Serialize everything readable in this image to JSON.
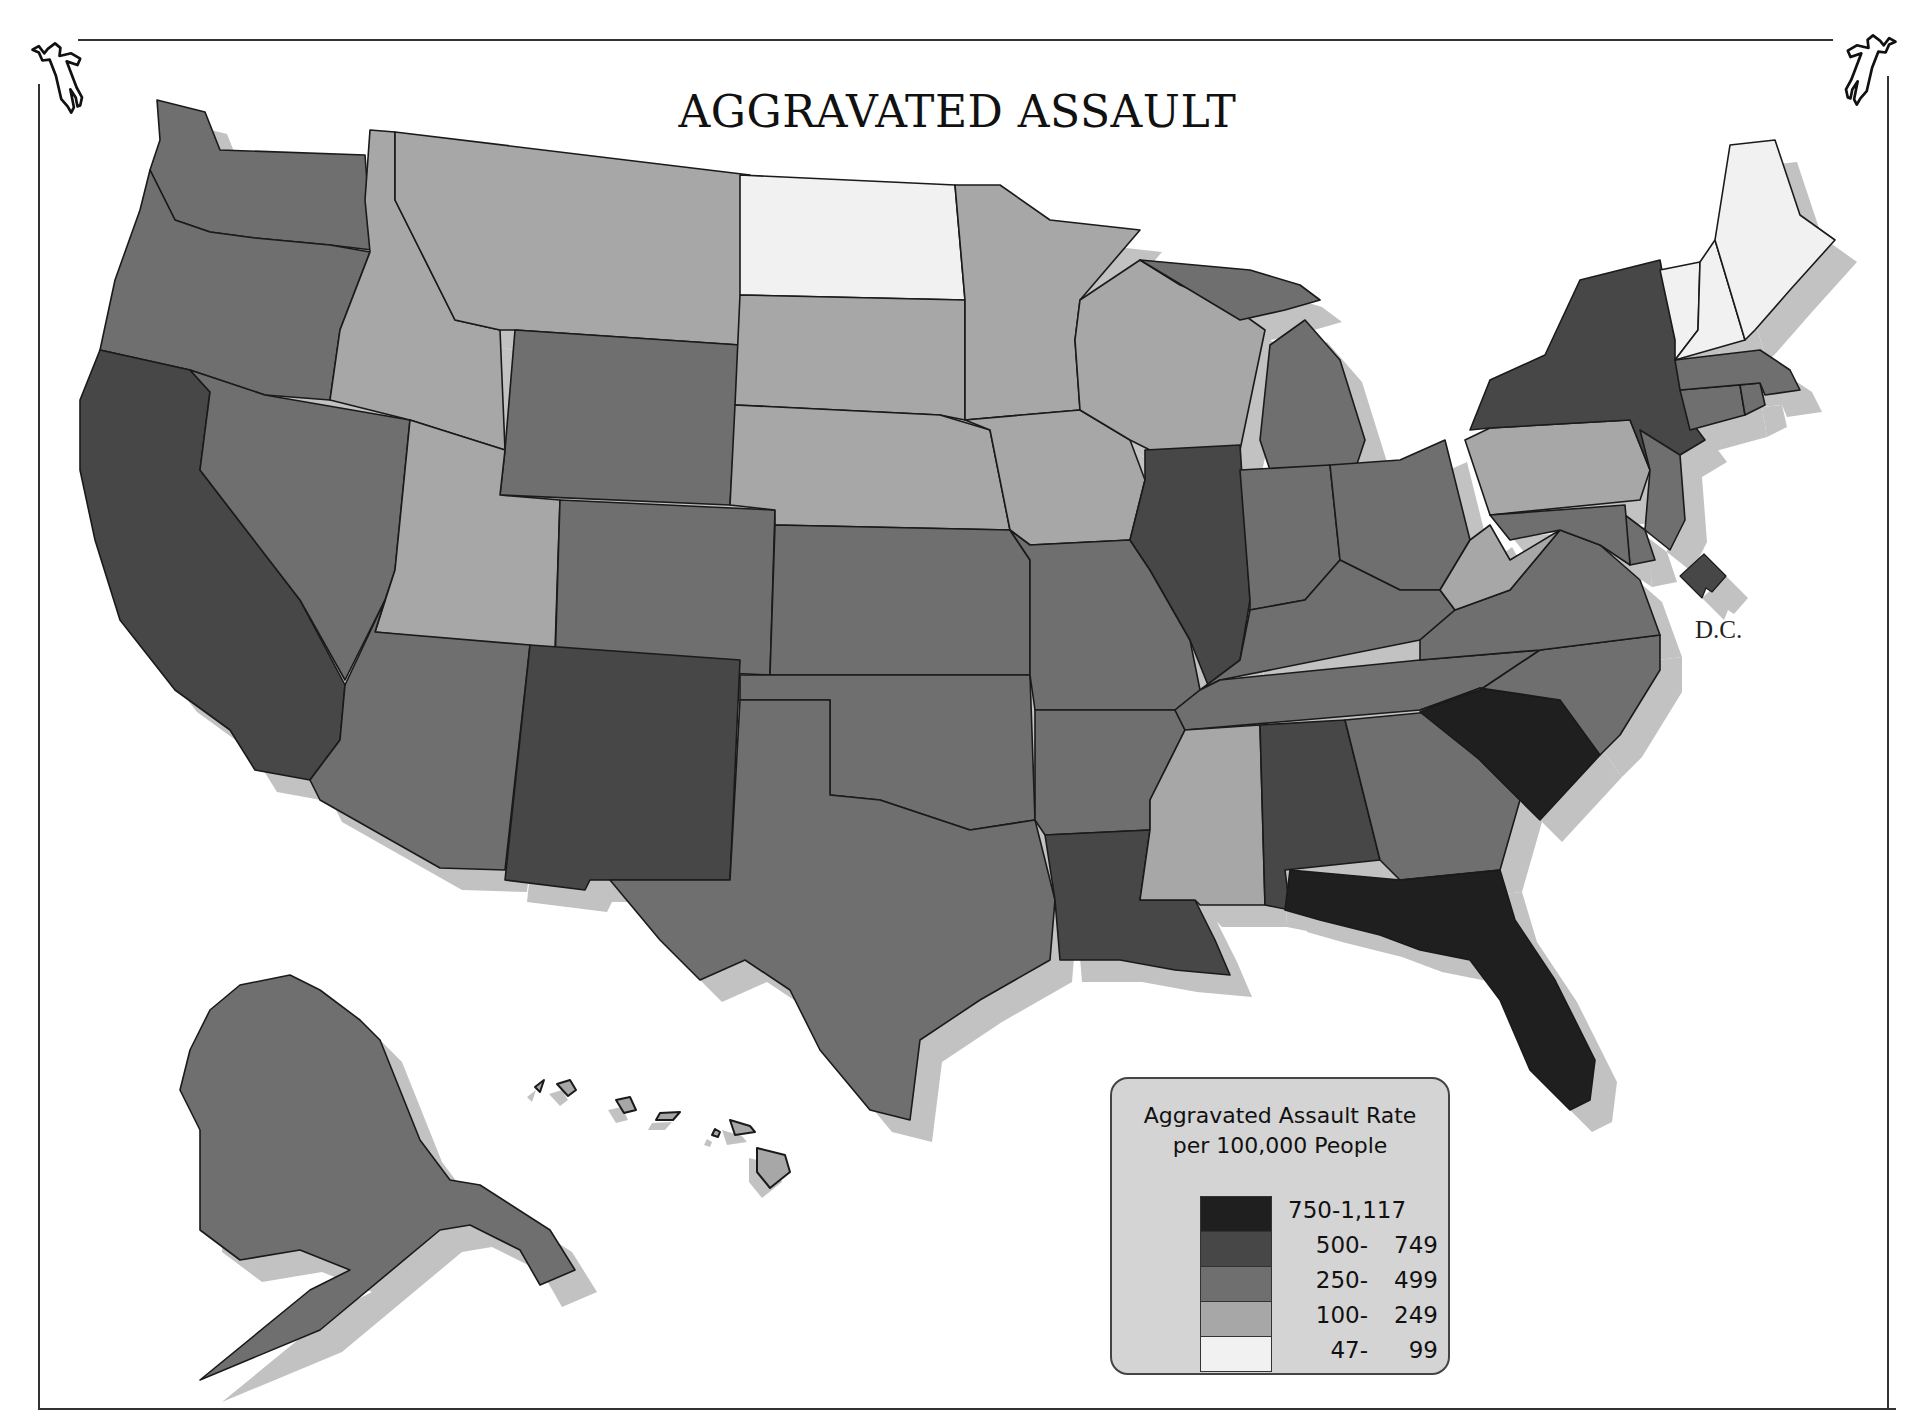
{
  "title": "AGGRAVATED ASSAULT",
  "icons": {
    "top_left": "body-outline-icon",
    "top_right": "body-outline-icon"
  },
  "dc_label": "D.C.",
  "legend": {
    "title_line1": "Aggravated Assault Rate",
    "title_line2": "per 100,000 People",
    "classes": [
      {
        "range": "750-1,117",
        "lo": "750-1,117",
        "hi": "",
        "color": "#1f1f1f",
        "full": true
      },
      {
        "range": "500- 749",
        "lo": "500-",
        "hi": "749",
        "color": "#474747",
        "full": false
      },
      {
        "range": "250- 499",
        "lo": "250-",
        "hi": "499",
        "color": "#6f6f6f",
        "full": false
      },
      {
        "range": "100- 249",
        "lo": "100-",
        "hi": "249",
        "color": "#a7a7a7",
        "full": false
      },
      {
        "range": "47- 99",
        "lo": "47-",
        "hi": "99",
        "color": "#f1f1f1",
        "full": false
      }
    ]
  },
  "colors": {
    "shadow": "#c2c2c2",
    "outline": "#1a1a1a",
    "legend_bg": "#d4d4d4"
  },
  "chart_data": {
    "type": "choropleth",
    "title": "AGGRAVATED ASSAULT",
    "legend_title": "Aggravated Assault Rate per 100,000 People",
    "classes": [
      "750-1,117",
      "500-749",
      "250-499",
      "100-249",
      "47-99"
    ],
    "states": {
      "FL": "750-1,117",
      "SC": "750-1,117",
      "CA": "500-749",
      "NM": "500-749",
      "IL": "500-749",
      "LA": "500-749",
      "AL": "500-749",
      "NY": "500-749",
      "DC": "500-749",
      "WA": "250-499",
      "OR": "250-499",
      "NV": "250-499",
      "AZ": "250-499",
      "WY": "250-499",
      "CO": "250-499",
      "KS": "250-499",
      "OK": "250-499",
      "TX": "250-499",
      "MO": "250-499",
      "AR": "250-499",
      "MI": "250-499",
      "IN": "250-499",
      "OH": "250-499",
      "KY": "250-499",
      "TN": "250-499",
      "GA": "250-499",
      "NC": "250-499",
      "VA": "250-499",
      "MD": "250-499",
      "DE": "250-499",
      "NJ": "250-499",
      "CT": "250-499",
      "RI": "250-499",
      "MA": "250-499",
      "AK": "250-499",
      "ID": "100-249",
      "MT": "100-249",
      "UT": "100-249",
      "SD": "100-249",
      "NE": "100-249",
      "MN": "100-249",
      "IA": "100-249",
      "WI": "100-249",
      "MS": "100-249",
      "PA": "100-249",
      "WV": "100-249",
      "HI": "100-249",
      "ND": "47-99",
      "ME": "47-99",
      "VT": "47-99",
      "NH": "47-99"
    }
  }
}
